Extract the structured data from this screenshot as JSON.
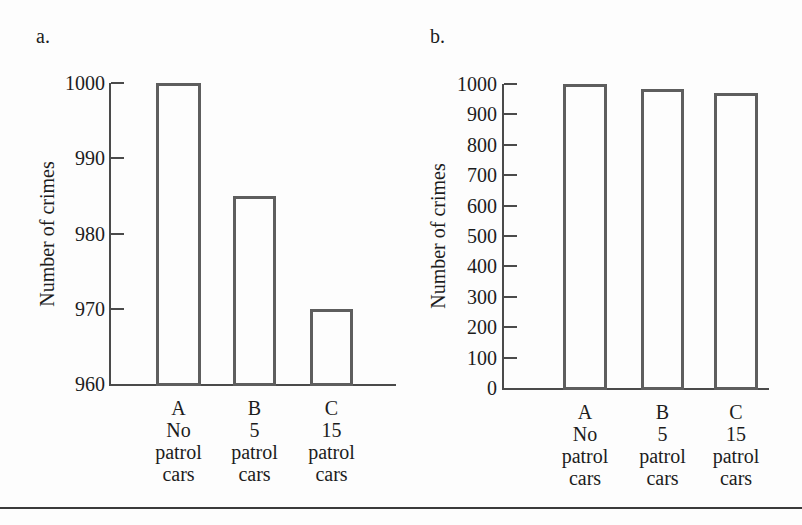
{
  "figure": {
    "description_title": "",
    "panels": [
      "a.",
      "b."
    ]
  },
  "colors": {
    "background": "#fdfdfd",
    "axis": "#4a4a4a",
    "bar_outline": "#5e5e5e",
    "text": "#1c1c1c",
    "divider_line": "#3a3a3a"
  },
  "chart_data": [
    {
      "id": "a",
      "type": "bar",
      "panel_label": "a.",
      "title": "",
      "xlabel": "",
      "ylabel": "Number of crimes",
      "categories": [
        [
          "A",
          "No",
          "patrol",
          "cars"
        ],
        [
          "B",
          "5",
          "patrol",
          "cars"
        ],
        [
          "C",
          "15",
          "patrol",
          "cars"
        ]
      ],
      "values": [
        1000,
        985,
        970
      ],
      "ylim": [
        960,
        1000
      ],
      "yticks": [
        960,
        970,
        980,
        990,
        1000
      ],
      "grid": false,
      "legend": false,
      "bar_fill": "none"
    },
    {
      "id": "b",
      "type": "bar",
      "panel_label": "b.",
      "title": "",
      "xlabel": "",
      "ylabel": "Number of crimes",
      "categories": [
        [
          "A",
          "No",
          "patrol",
          "cars"
        ],
        [
          "B",
          "5",
          "patrol",
          "cars"
        ],
        [
          "C",
          "15",
          "patrol",
          "cars"
        ]
      ],
      "values": [
        1000,
        985,
        970
      ],
      "ylim": [
        0,
        1000
      ],
      "yticks": [
        0,
        100,
        200,
        300,
        400,
        500,
        600,
        700,
        800,
        900,
        1000
      ],
      "grid": false,
      "legend": false,
      "bar_fill": "none"
    }
  ]
}
